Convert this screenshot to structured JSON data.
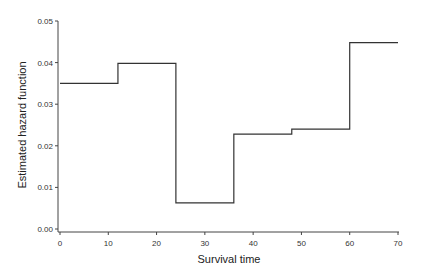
{
  "chart_data": {
    "type": "line",
    "style": "step",
    "title": "",
    "xlabel": "Survival time",
    "ylabel": "Estimated hazard function",
    "xlim": [
      0,
      70
    ],
    "ylim": [
      0,
      0.05
    ],
    "x_ticks": [
      "0",
      "10",
      "20",
      "30",
      "40",
      "50",
      "60",
      "70"
    ],
    "y_ticks": [
      "0.00",
      "0.01",
      "0.02",
      "0.03",
      "0.04",
      "0.05"
    ],
    "grid": false,
    "legend": null,
    "series": [
      {
        "name": "Estimated hazard",
        "color": "#333333",
        "steps": [
          {
            "x_start": 0,
            "x_end": 12,
            "y": 0.035
          },
          {
            "x_start": 12,
            "x_end": 24,
            "y": 0.0398
          },
          {
            "x_start": 24,
            "x_end": 36,
            "y": 0.0063
          },
          {
            "x_start": 36,
            "x_end": 48,
            "y": 0.0228
          },
          {
            "x_start": 48,
            "x_end": 60,
            "y": 0.024
          },
          {
            "x_start": 60,
            "x_end": 70,
            "y": 0.0448
          }
        ]
      }
    ]
  }
}
